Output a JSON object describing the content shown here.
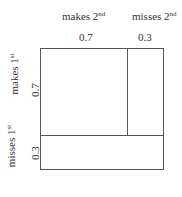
{
  "top_labels": {
    "col1": {
      "text": "makes 2",
      "sup": "nd",
      "prob": "0.7"
    },
    "col2": {
      "text": "misses 2",
      "sup": "nd",
      "prob": "0.3"
    }
  },
  "side_labels": {
    "row1": {
      "text": "makes 1",
      "sup": "st",
      "prob": "0.7"
    },
    "row2": {
      "text": "misses 1",
      "sup": "st",
      "prob": "0.3"
    }
  },
  "diagram": {
    "outer": {
      "x": 40,
      "y": 48,
      "w": 124,
      "h": 122
    },
    "vertical_split_x": 127,
    "horizontal_split_y": 135,
    "line_color": "#555555"
  }
}
